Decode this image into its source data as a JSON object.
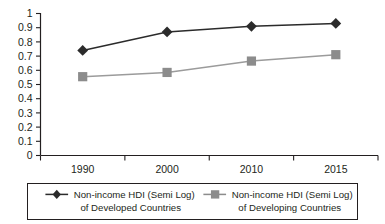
{
  "chart_data": {
    "type": "line",
    "title": "",
    "xlabel": "",
    "ylabel": "",
    "categories": [
      "1990",
      "2000",
      "2010",
      "2015"
    ],
    "ylim": [
      0,
      1
    ],
    "ytick_labels": [
      "0",
      "0.1",
      "0.2",
      "0.3",
      "0.4",
      "0.5",
      "0.6",
      "0.7",
      "0.8",
      "0.9",
      "1"
    ],
    "ytick_values": [
      0,
      0.1,
      0.2,
      0.3,
      0.4,
      0.5,
      0.6,
      0.7,
      0.8,
      0.9,
      1
    ],
    "grid": false,
    "legend_position": "bottom",
    "series": [
      {
        "name": "Non-income HDI (Semi Log) of Developed Countries",
        "name_line1": "Non-income HDI (Semi Log)",
        "name_line2": "of Developed Countries",
        "marker": "diamond",
        "color": "#2b2b2b",
        "values": [
          0.74,
          0.87,
          0.91,
          0.93
        ]
      },
      {
        "name": "Non-income HDI (Semi Log) of Developing Countries",
        "name_line1": "Non-income HDI (Semi Log)",
        "name_line2": "of Developing Countries",
        "marker": "square",
        "color": "#8c8c8c",
        "values": [
          0.555,
          0.585,
          0.665,
          0.71
        ]
      }
    ]
  },
  "colors": {
    "axis": "#231f20",
    "series_a": "#2b2b2b",
    "series_b": "#8c8c8c",
    "background": "#ffffff",
    "legend_border": "#231f20"
  }
}
